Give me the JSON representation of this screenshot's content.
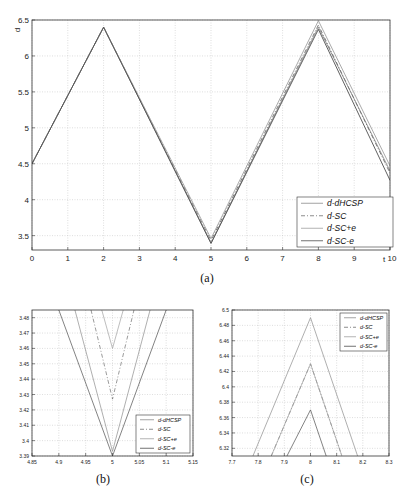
{
  "chart_data": [
    {
      "id": "a",
      "type": "line",
      "caption": "(a)",
      "title": "",
      "xlabel": "t",
      "ylabel": "d",
      "xlim": [
        0,
        10
      ],
      "ylim": [
        3.3,
        6.5
      ],
      "xticks": [
        0,
        1,
        2,
        3,
        4,
        5,
        6,
        7,
        8,
        9,
        10
      ],
      "xtick_labels": [
        "0",
        "1",
        "2",
        "3",
        "4",
        "5",
        "6",
        "7",
        "8",
        "9",
        "10"
      ],
      "yticks": [
        3.5,
        4,
        4.5,
        5,
        5.5,
        6,
        6.5
      ],
      "ytick_labels": [
        "3.5",
        "4",
        "4.5",
        "5",
        "5.5",
        "6",
        "6.5"
      ],
      "grid": true,
      "legend_position": "lower right",
      "series": [
        {
          "name": "d-dHCSP",
          "style": "solid",
          "color": "#8a8a8a",
          "x": [
            0,
            2,
            5,
            8,
            10
          ],
          "y": [
            4.5,
            6.4,
            3.4,
            6.4,
            4.4
          ]
        },
        {
          "name": "d-SC",
          "style": "dashdot",
          "color": "#6a6a6a",
          "x": [
            0,
            2,
            5,
            8,
            10
          ],
          "y": [
            4.5,
            6.4,
            3.43,
            6.43,
            4.37
          ]
        },
        {
          "name": "d-SC+e",
          "style": "solid",
          "color": "#9a9a9a",
          "x": [
            0,
            2,
            5,
            8,
            10
          ],
          "y": [
            4.5,
            6.4,
            3.46,
            6.49,
            4.47
          ]
        },
        {
          "name": "d-SC-e",
          "style": "solid",
          "color": "#555555",
          "x": [
            0,
            2,
            5,
            8,
            10
          ],
          "y": [
            4.5,
            6.4,
            3.39,
            6.37,
            4.27
          ]
        }
      ]
    },
    {
      "id": "b",
      "type": "line",
      "caption": "(b)",
      "xlim": [
        4.85,
        5.15
      ],
      "ylim": [
        3.39,
        3.485
      ],
      "xticks": [
        4.85,
        4.9,
        4.95,
        5,
        5.05,
        5.1,
        5.15
      ],
      "xtick_labels": [
        "4.85",
        "4.9",
        "4.95",
        "5",
        "5.05",
        "5.1",
        "5.15"
      ],
      "yticks": [
        3.39,
        3.4,
        3.41,
        3.42,
        3.43,
        3.44,
        3.45,
        3.46,
        3.47,
        3.48
      ],
      "ytick_labels": [
        "3.39",
        "3.4",
        "3.41",
        "3.42",
        "3.43",
        "3.44",
        "3.45",
        "3.46",
        "3.47",
        "3.48"
      ],
      "grid": true,
      "legend_position": "lower right",
      "series": [
        {
          "name": "d-dHCSP",
          "style": "solid",
          "x": [
            4.93,
            5.0,
            5.07
          ],
          "y": [
            3.485,
            3.393,
            3.485
          ]
        },
        {
          "name": "d-SC",
          "style": "dashdot",
          "x": [
            4.96,
            5.0,
            5.04
          ],
          "y": [
            3.485,
            3.427,
            3.485
          ]
        },
        {
          "name": "d-SC+e",
          "style": "solid",
          "x": [
            4.98,
            5.0,
            5.02
          ],
          "y": [
            3.485,
            3.46,
            3.485
          ]
        },
        {
          "name": "d-SC-e",
          "style": "solid",
          "x": [
            4.9,
            5.0,
            5.1
          ],
          "y": [
            3.485,
            3.39,
            3.485
          ]
        }
      ]
    },
    {
      "id": "c",
      "type": "line",
      "caption": "(c)",
      "xlim": [
        7.7,
        8.3
      ],
      "ylim": [
        6.31,
        6.5
      ],
      "xticks": [
        7.7,
        7.8,
        7.9,
        8,
        8.1,
        8.2,
        8.3
      ],
      "xtick_labels": [
        "7.7",
        "7.8",
        "7.9",
        "8",
        "8.1",
        "8.2",
        "8.3"
      ],
      "yticks": [
        6.32,
        6.34,
        6.36,
        6.38,
        6.4,
        6.42,
        6.44,
        6.46,
        6.48,
        6.5
      ],
      "ytick_labels": [
        "6.32",
        "6.34",
        "6.36",
        "6.38",
        "6.4",
        "6.42",
        "6.44",
        "6.46",
        "6.48",
        "6.5"
      ],
      "grid": true,
      "legend_position": "upper right",
      "series": [
        {
          "name": "d-dHCSP",
          "style": "solid",
          "x": [
            7.78,
            8.0,
            8.18
          ],
          "y": [
            6.31,
            6.49,
            6.31
          ]
        },
        {
          "name": "d-SC",
          "style": "dashdot",
          "x": [
            7.85,
            8.0,
            8.12
          ],
          "y": [
            6.31,
            6.43,
            6.31
          ]
        },
        {
          "name": "d-SC+e",
          "style": "solid",
          "x": [
            7.85,
            8.0,
            8.12
          ],
          "y": [
            6.31,
            6.43,
            6.31
          ]
        },
        {
          "name": "d-SC-e",
          "style": "solid",
          "x": [
            7.91,
            8.0,
            8.06
          ],
          "y": [
            6.31,
            6.37,
            6.31
          ]
        }
      ]
    }
  ],
  "legend": [
    "d-dHCSP",
    "d-SC",
    "d-SC+e",
    "d-SC-e"
  ],
  "captions": {
    "a": "(a)",
    "b": "(b)",
    "c": "(c)"
  },
  "axis_labels": {
    "a_x": "t",
    "a_y": "d"
  }
}
